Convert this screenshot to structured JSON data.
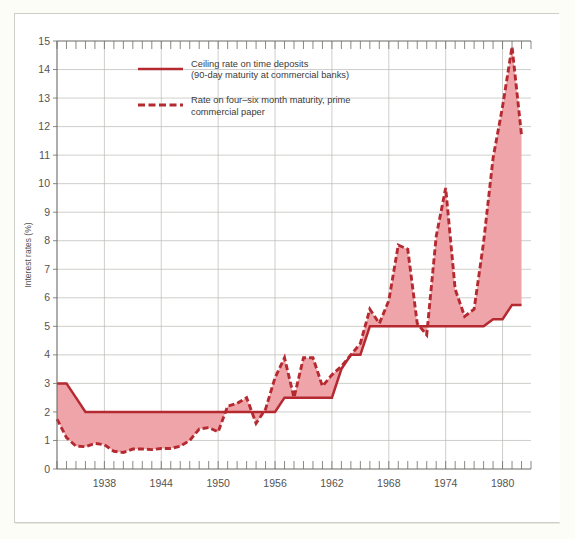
{
  "chart_data": {
    "type": "area",
    "title": "",
    "xlabel": "",
    "ylabel": "Interest rates (%)",
    "xlim": [
      1933,
      1983
    ],
    "ylim": [
      0,
      15
    ],
    "grid": true,
    "y_ticks": [
      0,
      1,
      2,
      3,
      4,
      5,
      6,
      7,
      8,
      9,
      10,
      11,
      12,
      13,
      14,
      15
    ],
    "y_tick_labels": [
      "0",
      "1",
      "2",
      "3",
      "4",
      "5",
      "6",
      "7",
      "8",
      "9",
      "10",
      "11",
      "12",
      "13",
      "14",
      "15"
    ],
    "x_ticks": [
      1938,
      1944,
      1950,
      1956,
      1962,
      1968,
      1974,
      1980
    ],
    "x_tick_labels": [
      "1938",
      "1944",
      "1950",
      "1956",
      "1962",
      "1968",
      "1974",
      "1980"
    ],
    "x_minor_tick_interval": 1,
    "legend_position": "upper-left-inside",
    "colors": {
      "line": "#b42a30",
      "fill": "#eea4a8",
      "grid": "#b9b9b4",
      "axis": "#6b6b66",
      "page_background": "#fdfdf8",
      "plot_background": "#ffffff"
    },
    "series": [
      {
        "name": "Ceiling rate on time deposits (90-day maturity at commercial banks)",
        "legend_label_line1": "Ceiling rate on time deposits",
        "legend_label_line2": "(90-day maturity at commercial banks)",
        "style": "solid",
        "x": [
          1933,
          1934,
          1935,
          1936,
          1937,
          1938,
          1939,
          1940,
          1941,
          1942,
          1943,
          1944,
          1945,
          1946,
          1947,
          1948,
          1949,
          1950,
          1951,
          1952,
          1953,
          1954,
          1955,
          1956,
          1957,
          1958,
          1959,
          1960,
          1961,
          1962,
          1963,
          1964,
          1965,
          1966,
          1967,
          1968,
          1969,
          1970,
          1971,
          1972,
          1973,
          1974,
          1975,
          1976,
          1977,
          1978,
          1979,
          1980,
          1981,
          1982
        ],
        "y": [
          3.0,
          3.0,
          2.5,
          2.0,
          2.0,
          2.0,
          2.0,
          2.0,
          2.0,
          2.0,
          2.0,
          2.0,
          2.0,
          2.0,
          2.0,
          2.0,
          2.0,
          2.0,
          2.0,
          2.0,
          2.0,
          2.0,
          2.0,
          2.0,
          2.5,
          2.5,
          2.5,
          2.5,
          2.5,
          2.5,
          3.5,
          4.0,
          4.0,
          5.0,
          5.0,
          5.0,
          5.0,
          5.0,
          5.0,
          5.0,
          5.0,
          5.0,
          5.0,
          5.0,
          5.0,
          5.0,
          5.25,
          5.25,
          5.75,
          5.75
        ]
      },
      {
        "name": "Rate on four-six month maturity, prime commercial paper",
        "legend_label_line1": "Rate on four–six month maturity, prime",
        "legend_label_line2": "commercial paper",
        "style": "dashed",
        "x": [
          1933,
          1934,
          1935,
          1936,
          1937,
          1938,
          1939,
          1940,
          1941,
          1942,
          1943,
          1944,
          1945,
          1946,
          1947,
          1948,
          1949,
          1950,
          1951,
          1952,
          1953,
          1954,
          1955,
          1956,
          1957,
          1958,
          1959,
          1960,
          1961,
          1962,
          1963,
          1964,
          1965,
          1966,
          1967,
          1968,
          1969,
          1970,
          1971,
          1972,
          1973,
          1974,
          1975,
          1976,
          1977,
          1978,
          1979,
          1980,
          1981,
          1982
        ],
        "y": [
          1.75,
          1.1,
          0.8,
          0.78,
          0.9,
          0.85,
          0.62,
          0.58,
          0.7,
          0.7,
          0.68,
          0.72,
          0.72,
          0.8,
          1.0,
          1.4,
          1.45,
          1.3,
          2.2,
          2.3,
          2.5,
          1.6,
          2.1,
          3.2,
          3.9,
          2.5,
          3.9,
          3.9,
          2.9,
          3.3,
          3.6,
          4.0,
          4.4,
          5.6,
          5.1,
          5.9,
          7.85,
          7.7,
          5.1,
          4.7,
          8.15,
          9.85,
          6.3,
          5.35,
          5.6,
          7.95,
          10.9,
          12.7,
          14.8,
          11.7
        ]
      }
    ],
    "annotations": [
      "Shaded area between the commercial paper rate and the ceiling rate on time deposits"
    ]
  },
  "legend": {
    "entries": [
      {
        "swatch": "solid-line-swatch",
        "line1": "Ceiling rate on time deposits",
        "line2": "(90-day maturity at commercial banks)"
      },
      {
        "swatch": "dashed-line-swatch",
        "line1": "Rate on four–six month maturity, prime",
        "line2": "commercial paper"
      }
    ]
  },
  "axes": {
    "y_axis_title": "Interest rates (%)",
    "y_labels": [
      "15",
      "14",
      "13",
      "12",
      "11",
      "10",
      "9",
      "8",
      "7",
      "6",
      "5",
      "4",
      "3",
      "2",
      "1",
      "0"
    ],
    "x_labels": [
      "1938",
      "1944",
      "1950",
      "1956",
      "1962",
      "1968",
      "1974",
      "1980"
    ]
  }
}
